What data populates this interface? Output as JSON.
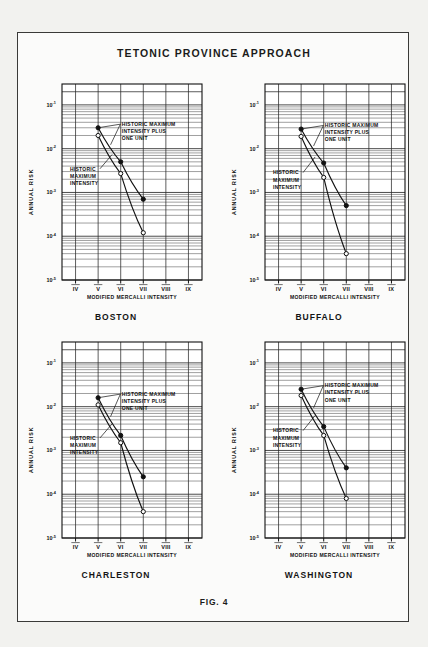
{
  "figure": {
    "title": "TETONIC  PROVINCE  APPROACH",
    "caption": "FIG. 4"
  },
  "axes_common": {
    "xlabel": "MODIFIED MERCALLI INTENSITY",
    "ylabel": "ANNUAL RISK",
    "x_tick_labels": [
      "IV",
      "V",
      "VI",
      "VII",
      "VIII",
      "IX"
    ],
    "y_tick_labels": [
      "10-1",
      "10-2",
      "10-3",
      "10-4",
      "10-5"
    ],
    "y_tick_bases": [
      "10",
      "10",
      "10",
      "10",
      "10"
    ],
    "y_tick_exponents": [
      "-1",
      "-2",
      "-3",
      "-4",
      "-5"
    ],
    "annotation_upper": "HISTORIC MAXIMUM INTENSITY PLUS ONE UNIT",
    "annotation_upper_lines": [
      "HISTORIC MAXIMUM",
      "INTENSITY PLUS",
      "ONE UNIT"
    ],
    "annotation_lower": "HISTORIC MAXIMUM INTENSITY",
    "annotation_lower_lines": [
      "HISTORIC",
      "MAXIMUM",
      "INTENSITY"
    ],
    "xlim": [
      3.4,
      9.6
    ],
    "ylim": [
      1e-05,
      0.3
    ],
    "grid": "log-minor-horizontal-and-vertical",
    "legend_position": "inline-annotation"
  },
  "colors": {
    "ink": "#111111",
    "grid": "#2a2a2a",
    "page": "#f2f2ef",
    "panel": "#fbfbfa",
    "marker_filled": "#111111",
    "marker_open": "#fbfbfa"
  },
  "chart_data": [
    {
      "id": "boston",
      "type": "line",
      "title": "BOSTON",
      "xlabel": "MODIFIED MERCALLI INTENSITY",
      "ylabel": "ANNUAL RISK",
      "categories": [
        "IV",
        "V",
        "VI",
        "VII",
        "VIII",
        "IX"
      ],
      "x": [
        4,
        5,
        6,
        7,
        8,
        9
      ],
      "ylim": [
        1e-05,
        0.3
      ],
      "xlim": [
        3.4,
        9.6
      ],
      "series": [
        {
          "name": "HISTORIC MAXIMUM INTENSITY PLUS ONE UNIT",
          "marker": "filled-circle",
          "x": [
            5,
            6,
            7
          ],
          "values": [
            0.03,
            0.005,
            0.0007
          ]
        },
        {
          "name": "HISTORIC MAXIMUM INTENSITY",
          "marker": "open-circle",
          "x": [
            5,
            6,
            7
          ],
          "values": [
            0.02,
            0.0027,
            0.00012
          ]
        }
      ]
    },
    {
      "id": "buffalo",
      "type": "line",
      "title": "BUFFALO",
      "xlabel": "MODIFIED MERCALLI INTENSITY",
      "ylabel": "ANNUAL RISK",
      "categories": [
        "IV",
        "V",
        "VI",
        "VII",
        "VIII",
        "IX"
      ],
      "x": [
        4,
        5,
        6,
        7,
        8,
        9
      ],
      "ylim": [
        1e-05,
        0.3
      ],
      "xlim": [
        3.4,
        9.6
      ],
      "series": [
        {
          "name": "HISTORIC MAXIMUM INTENSITY PLUS ONE UNIT",
          "marker": "filled-circle",
          "x": [
            5,
            6,
            7
          ],
          "values": [
            0.028,
            0.0047,
            0.0005
          ]
        },
        {
          "name": "HISTORIC MAXIMUM INTENSITY",
          "marker": "open-circle",
          "x": [
            5,
            6,
            7
          ],
          "values": [
            0.019,
            0.0022,
            4e-05
          ]
        }
      ]
    },
    {
      "id": "charleston",
      "type": "line",
      "title": "CHARLESTON",
      "xlabel": "MODIFIED MERCALLI INTENSITY",
      "ylabel": "ANNUAL RISK",
      "categories": [
        "IV",
        "V",
        "VI",
        "VII",
        "VIII",
        "IX"
      ],
      "x": [
        4,
        5,
        6,
        7,
        8,
        9
      ],
      "ylim": [
        1e-05,
        0.3
      ],
      "xlim": [
        3.4,
        9.6
      ],
      "series": [
        {
          "name": "HISTORIC MAXIMUM INTENSITY PLUS ONE UNIT",
          "marker": "filled-circle",
          "x": [
            5,
            6,
            7
          ],
          "values": [
            0.016,
            0.0022,
            0.00025
          ]
        },
        {
          "name": "HISTORIC MAXIMUM INTENSITY",
          "marker": "open-circle",
          "x": [
            5,
            6,
            7
          ],
          "values": [
            0.011,
            0.0015,
            4e-05
          ]
        }
      ]
    },
    {
      "id": "washington",
      "type": "line",
      "title": "WASHINGTON",
      "xlabel": "MODIFIED MERCALLI INTENSITY",
      "ylabel": "ANNUAL RISK",
      "categories": [
        "IV",
        "V",
        "VI",
        "VII",
        "VIII",
        "IX"
      ],
      "x": [
        4,
        5,
        6,
        7,
        8,
        9
      ],
      "ylim": [
        1e-05,
        0.3
      ],
      "xlim": [
        3.4,
        9.6
      ],
      "series": [
        {
          "name": "HISTORIC MAXIMUM INTENSITY PLUS ONE UNIT",
          "marker": "filled-circle",
          "x": [
            5,
            6,
            7
          ],
          "values": [
            0.025,
            0.0035,
            0.0004
          ]
        },
        {
          "name": "HISTORIC MAXIMUM INTENSITY",
          "marker": "open-circle",
          "x": [
            5,
            6,
            7
          ],
          "values": [
            0.018,
            0.0022,
            8e-05
          ]
        }
      ]
    }
  ]
}
